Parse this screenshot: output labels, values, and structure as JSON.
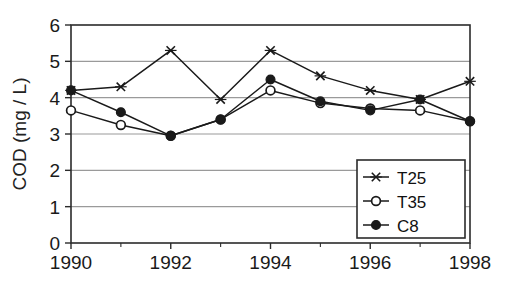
{
  "chart_data": {
    "type": "line",
    "title": "",
    "xlabel": "",
    "ylabel": "COD (mg / L)",
    "x": [
      1990,
      1991,
      1992,
      1993,
      1994,
      1995,
      1996,
      1997,
      1998
    ],
    "xlim": [
      1990,
      1998
    ],
    "ylim": [
      0,
      6
    ],
    "xticks": [
      1990,
      1992,
      1994,
      1996,
      1998
    ],
    "xtick_labels": [
      "1990",
      "1992",
      "1994",
      "1996",
      "1998"
    ],
    "xminor_ticks": [
      1991,
      1993,
      1995,
      1997
    ],
    "yticks": [
      0,
      1,
      2,
      3,
      4,
      5,
      6
    ],
    "ytick_labels": [
      "0",
      "1",
      "2",
      "3",
      "4",
      "5",
      "6"
    ],
    "grid": "horizontal",
    "legend_position": "bottom-right",
    "series": [
      {
        "name": "T25",
        "marker": "x-cross",
        "fill": "none",
        "values": [
          4.2,
          4.3,
          5.3,
          3.95,
          5.3,
          4.6,
          4.2,
          3.95,
          4.45
        ]
      },
      {
        "name": "T35",
        "marker": "open-circle",
        "fill": "#ffffff",
        "values": [
          3.65,
          3.25,
          2.95,
          3.4,
          4.2,
          3.85,
          3.7,
          3.65,
          3.35
        ]
      },
      {
        "name": "C8",
        "marker": "filled-circle",
        "fill": "#111111",
        "values": [
          4.2,
          3.6,
          2.95,
          3.4,
          4.5,
          3.9,
          3.65,
          3.95,
          3.35
        ]
      }
    ]
  },
  "legend": {
    "entries": [
      {
        "label": "T25"
      },
      {
        "label": "T35"
      },
      {
        "label": "C8"
      }
    ]
  },
  "colors": {
    "line": "#1a1a1a",
    "grid": "#9a9a9a",
    "frame": "#2b2b2b",
    "text": "#1a1a1a",
    "background": "#ffffff"
  }
}
